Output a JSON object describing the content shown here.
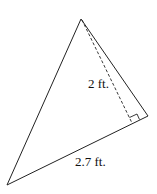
{
  "diagram": {
    "type": "triangle",
    "vertices": {
      "top": [
        81,
        19
      ],
      "right": [
        148,
        116
      ],
      "bottom_left": [
        7,
        185
      ]
    },
    "height_foot": [
      132,
      123
    ],
    "labels": {
      "height": "2 ft.",
      "base": "2.7 ft."
    },
    "colors": {
      "stroke": "#222222",
      "text": "#111111"
    }
  }
}
